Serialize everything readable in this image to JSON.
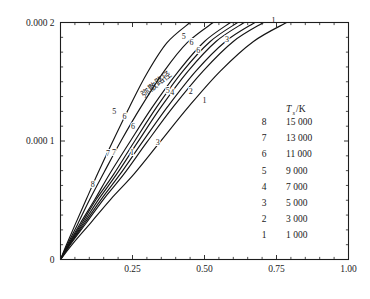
{
  "chart_data": {
    "type": "line",
    "title": "",
    "xlabel": "x/m",
    "ylabel": "t/s",
    "xlim": [
      0,
      1.0
    ],
    "ylim": [
      0,
      0.0002
    ],
    "grid": false,
    "legend_position": "inside-right",
    "x_ticks": [
      {
        "value": 0,
        "label": "0"
      },
      {
        "value": 0.25,
        "label": "0.25"
      },
      {
        "value": 0.5,
        "label": "0.50"
      },
      {
        "value": 0.75,
        "label": "0.75"
      },
      {
        "value": 1.0,
        "label": "1.00"
      }
    ],
    "y_ticks": [
      {
        "value": 0,
        "label": "0"
      },
      {
        "value": 0.0001,
        "label": "0.000 1"
      },
      {
        "value": 0.0002,
        "label": "0.000 2"
      }
    ],
    "x_minor_tick_step": 0.05,
    "y_minor_tick_step": 1.25e-05,
    "annotations": [
      {
        "text": "弥散路径",
        "x": 0.34,
        "y": 0.000146,
        "rotation": -38
      }
    ],
    "series": [
      {
        "name": "8",
        "label": "8",
        "legend_value": "15 000",
        "x": [
          0,
          0.02,
          0.05,
          0.09,
          0.13,
          0.18,
          0.24,
          0.3,
          0.37,
          0.45
        ],
        "y": [
          0,
          1.2e-05,
          2.9e-05,
          5.1e-05,
          7.3e-05,
          9.9e-05,
          0.000129,
          0.000157,
          0.000183,
          0.0002
        ]
      },
      {
        "name": "7",
        "label": "7",
        "legend_value": "13 000",
        "x": [
          0,
          0.025,
          0.06,
          0.1,
          0.15,
          0.21,
          0.28,
          0.36,
          0.44,
          0.53
        ],
        "y": [
          0,
          1.3e-05,
          3e-05,
          5e-05,
          7.3e-05,
          0.0001,
          0.000129,
          0.000159,
          0.000183,
          0.0002
        ]
      },
      {
        "name": "6",
        "label": "6",
        "legend_value": "11 000",
        "x": [
          0,
          0.03,
          0.07,
          0.12,
          0.17,
          0.24,
          0.32,
          0.41,
          0.5,
          0.59
        ],
        "y": [
          0,
          1.4e-05,
          3.1e-05,
          5.1e-05,
          7.2e-05,
          9.9e-05,
          0.000129,
          0.000159,
          0.000184,
          0.0002
        ]
      },
      {
        "name": "5",
        "label": "5",
        "legend_value": "9 000",
        "x": [
          0,
          0.032,
          0.075,
          0.125,
          0.185,
          0.255,
          0.335,
          0.425,
          0.52,
          0.615
        ],
        "y": [
          0,
          1.4e-05,
          3.1e-05,
          5.1e-05,
          7.2e-05,
          9.9e-05,
          0.000129,
          0.000159,
          0.000184,
          0.0002
        ]
      },
      {
        "name": "4",
        "label": "4",
        "legend_value": "7 000",
        "x": [
          0,
          0.034,
          0.08,
          0.133,
          0.195,
          0.268,
          0.35,
          0.443,
          0.54,
          0.638
        ],
        "y": [
          0,
          1.4e-05,
          3.1e-05,
          5.1e-05,
          7.2e-05,
          9.9e-05,
          0.000129,
          0.000159,
          0.000184,
          0.0002
        ]
      },
      {
        "name": "3",
        "label": "3",
        "legend_value": "5 000",
        "x": [
          0,
          0.036,
          0.085,
          0.142,
          0.207,
          0.284,
          0.372,
          0.47,
          0.573,
          0.675
        ],
        "y": [
          0,
          1.4e-05,
          3.1e-05,
          5.1e-05,
          7.2e-05,
          9.9e-05,
          0.000129,
          0.000159,
          0.000184,
          0.0002
        ]
      },
      {
        "name": "2",
        "label": "2",
        "legend_value": "3 000",
        "x": [
          0,
          0.038,
          0.09,
          0.15,
          0.22,
          0.3,
          0.392,
          0.495,
          0.6,
          0.705
        ],
        "y": [
          0,
          1.4e-05,
          3.1e-05,
          5.1e-05,
          7.2e-05,
          9.9e-05,
          0.000129,
          0.000159,
          0.000184,
          0.0002
        ]
      },
      {
        "name": "1",
        "label": "1",
        "legend_value": "1 000",
        "x": [
          0,
          0.045,
          0.105,
          0.175,
          0.255,
          0.345,
          0.445,
          0.555,
          0.67,
          0.785
        ],
        "y": [
          0,
          1.4e-05,
          3.1e-05,
          5.1e-05,
          7.2e-05,
          9.9e-05,
          0.000129,
          0.000159,
          0.000184,
          0.0002
        ]
      }
    ],
    "curve_labels": [
      {
        "text": "8",
        "x": 0.112,
        "y": 6.12e-05
      },
      {
        "text": "7",
        "x": 0.165,
        "y": 8.7e-05
      },
      {
        "text": "7",
        "x": 0.186,
        "y": 8.83e-05
      },
      {
        "text": "5",
        "x": 0.187,
        "y": 0.0001225
      },
      {
        "text": "5",
        "x": 0.428,
        "y": 0.0001863
      },
      {
        "text": "6",
        "x": 0.222,
        "y": 0.0001185
      },
      {
        "text": "6",
        "x": 0.252,
        "y": 0.0001105
      },
      {
        "text": "6",
        "x": 0.455,
        "y": 0.0001808
      },
      {
        "text": "6",
        "x": 0.478,
        "y": 0.000174
      },
      {
        "text": "5",
        "x": 0.372,
        "y": 0.0001405
      },
      {
        "text": "4",
        "x": 0.388,
        "y": 0.0001392
      },
      {
        "text": "3",
        "x": 0.338,
        "y": 9.65e-05
      },
      {
        "text": "3",
        "x": 0.578,
        "y": 0.0001838
      },
      {
        "text": "2",
        "x": 0.452,
        "y": 0.00014
      },
      {
        "text": "1",
        "x": 0.248,
        "y": 8.85e-05
      },
      {
        "text": "1",
        "x": 0.5,
        "y": 0.000132
      },
      {
        "text": "1",
        "x": 0.74,
        "y": 0.0002
      }
    ],
    "legend": {
      "header": "T",
      "header_sub": "s",
      "header_unit": "/K",
      "rows": [
        {
          "key": "8",
          "value": "15 000"
        },
        {
          "key": "7",
          "value": "13 000"
        },
        {
          "key": "6",
          "value": "11 000"
        },
        {
          "key": "5",
          "value": "9 000"
        },
        {
          "key": "4",
          "value": "7 000"
        },
        {
          "key": "3",
          "value": "5 000"
        },
        {
          "key": "2",
          "value": "3 000"
        },
        {
          "key": "1",
          "value": "1 000"
        }
      ]
    },
    "axis_title_x_var": "x",
    "axis_title_x_unit": "/m",
    "axis_title_y_var": "t",
    "axis_title_y_unit": "/s"
  },
  "colors": {
    "background": "#ffffff",
    "axis": "#1d1d1d",
    "curve": "#141414",
    "text": "#1a1a1a"
  }
}
